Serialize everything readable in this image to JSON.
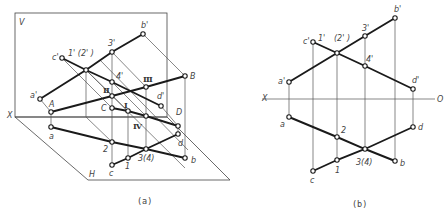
{
  "figure": {
    "panel_a": {
      "caption": "(a)",
      "plane_v_label": "V",
      "plane_h_label": "H",
      "axis_x_label": "X",
      "labels": {
        "b_prime": "b'",
        "three_prime": "3'",
        "c_prime": "c'",
        "one_two_prime": "1'  (2' )",
        "four_prime": "4'",
        "roman_3": "Ⅲ",
        "roman_2": "Ⅱ",
        "roman_1": "Ⅰ",
        "roman_4": "Ⅳ",
        "B": "B",
        "a_prime": "a'",
        "A": "A",
        "C": "C",
        "d_prime": "d'",
        "D": "D",
        "a": "a",
        "two": "2",
        "three_four": "3(4)",
        "d": "d",
        "b": "b",
        "one": "1",
        "c": "c"
      }
    },
    "panel_b": {
      "caption": "(b)",
      "axis_x_label": "X",
      "axis_o_label": "O",
      "labels": {
        "b_prime": "b'",
        "three_prime": "3'",
        "c_prime": "c'",
        "one_prime": "1'",
        "two_prime": "(2' )",
        "four_prime": "4'",
        "a_prime": "a'",
        "d_prime": "d'",
        "a": "a",
        "two": "2",
        "d": "d",
        "three_four": "3(4)",
        "b": "b",
        "one": "1",
        "c": "c"
      }
    },
    "colors": {
      "line_heavy": "#1a1a1a",
      "line_thin": "#555555",
      "label": "#444444",
      "background": "#ffffff"
    }
  }
}
